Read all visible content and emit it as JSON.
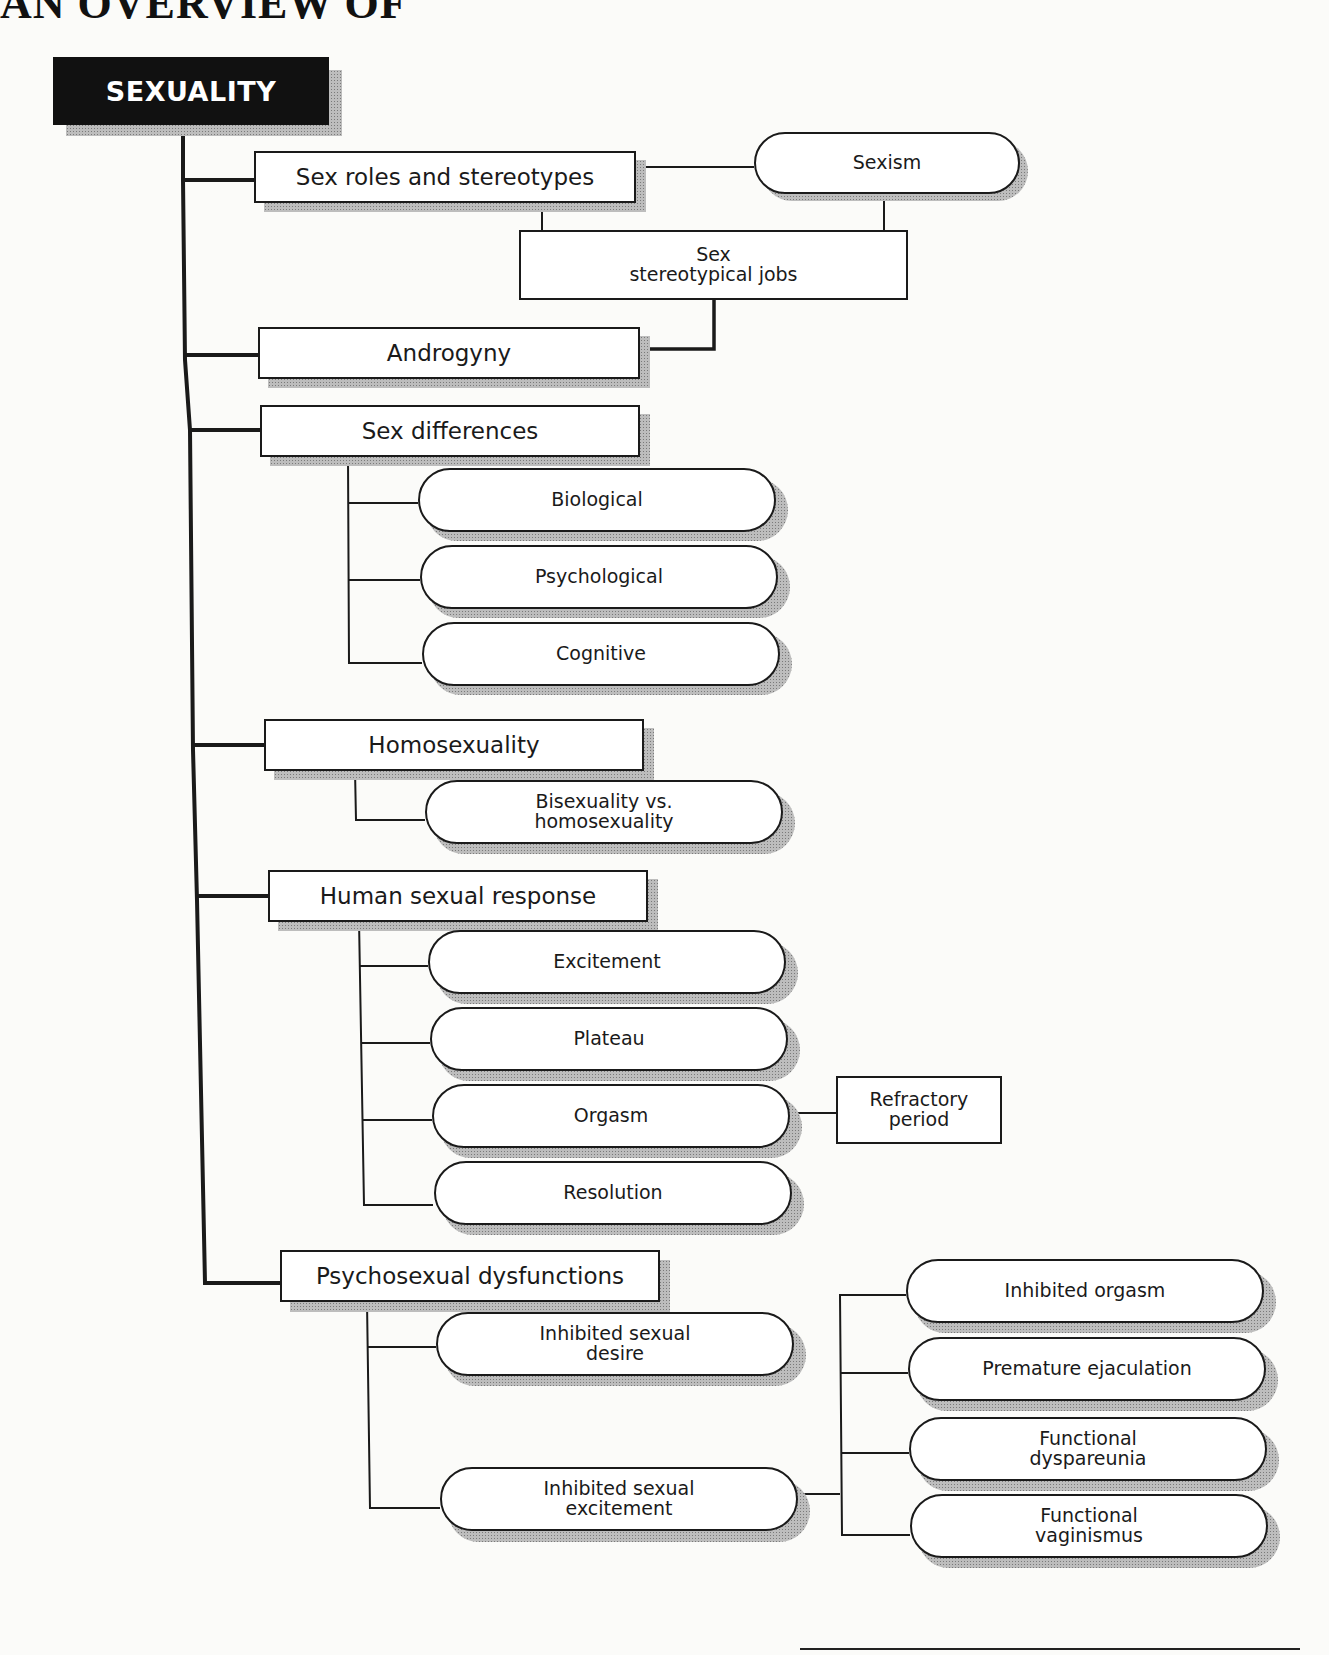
{
  "page": {
    "header_fragment": "AN OVERVIEW OF",
    "title": "SEXUALITY"
  },
  "topics": [
    {
      "label": "Sex roles and stereotypes",
      "related": [
        "Sexism",
        "Sex\nstereotypical jobs"
      ]
    },
    {
      "label": "Androgyny",
      "related_from": "Sex\nstereotypical jobs"
    },
    {
      "label": "Sex differences",
      "children": [
        "Biological",
        "Psychological",
        "Cognitive"
      ]
    },
    {
      "label": "Homosexuality",
      "children": [
        "Bisexuality vs.\nhomosexuality"
      ]
    },
    {
      "label": "Human sexual response",
      "children": [
        "Excitement",
        "Plateau",
        "Orgasm",
        "Resolution"
      ],
      "orgasm_related": "Refractory\nperiod"
    },
    {
      "label": "Psychosexual dysfunctions",
      "children": [
        "Inhibited sexual\ndesire",
        "Inhibited sexual\nexcitement"
      ],
      "excitement_children": [
        "Inhibited orgasm",
        "Premature ejaculation",
        "Functional\ndyspareunia",
        "Functional\nvaginismus"
      ]
    }
  ],
  "colors": {
    "title_bg": "#111111",
    "title_text": "#ffffff",
    "line": "#1a1a1a",
    "shadow": "#9a9a9a"
  }
}
